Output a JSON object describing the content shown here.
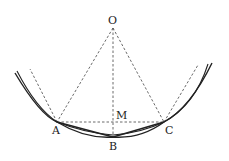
{
  "diagram": {
    "type": "geometry",
    "colors": {
      "stroke": "#222222",
      "dashed": "#444444",
      "background": "#ffffff"
    },
    "points": {
      "O": {
        "label": "O",
        "x": 113,
        "y": 28
      },
      "A": {
        "label": "A",
        "x": 57,
        "y": 122
      },
      "B": {
        "label": "B",
        "x": 113,
        "y": 137
      },
      "C": {
        "label": "C",
        "x": 164,
        "y": 122
      },
      "M": {
        "label": "M",
        "x": 113,
        "y": 122
      }
    },
    "labels": {
      "O": "O",
      "A": "A",
      "B": "B",
      "C": "C",
      "M": "M"
    },
    "edges": {
      "solid": [
        "arc",
        "arc-inner",
        "A-B",
        "B-C"
      ],
      "dashed": [
        "O-A",
        "O-C",
        "O-B",
        "A-C",
        "A-tangent",
        "C-tangent"
      ]
    }
  }
}
